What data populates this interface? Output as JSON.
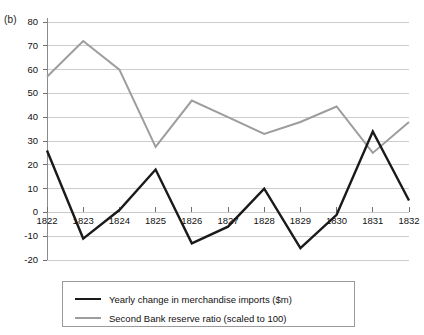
{
  "figure": {
    "panel_label": "(b)",
    "background_color": "#ffffff"
  },
  "chart_data": {
    "type": "line",
    "title": "",
    "subtitle": "",
    "xlabel": "",
    "ylabel": "",
    "categories": [
      "1822",
      "1823",
      "1824",
      "1825",
      "1826",
      "1827",
      "1828",
      "1829",
      "1830",
      "1831",
      "1832"
    ],
    "x_tick_labels": [
      "1822",
      "1823",
      "1824",
      "1825",
      "1826",
      "1827",
      "1828",
      "1829",
      "1830",
      "1831",
      "1832"
    ],
    "y_tick_labels": [
      "80",
      "70",
      "60",
      "50",
      "40",
      "30",
      "20",
      "10",
      "0",
      "-10",
      "-20"
    ],
    "y_ticks": [
      80,
      70,
      60,
      50,
      40,
      30,
      20,
      10,
      0,
      -10,
      -20
    ],
    "ylim": [
      -20,
      80
    ],
    "grid": true,
    "grid_color": "#c8c8c8",
    "zero_line": 0,
    "legend_position": "bottom",
    "series": [
      {
        "name": "Yearly change in merchandise imports ($m)",
        "color": "#1a1a1a",
        "width": 2.4,
        "values": [
          26,
          -11,
          1,
          18,
          -13,
          -6,
          10,
          -15,
          -1,
          34,
          5
        ]
      },
      {
        "name": "Second Bank reserve ratio (scaled to 100)",
        "color": "#9d9d9d",
        "width": 2.0,
        "values": [
          57,
          72,
          60,
          27.5,
          47,
          40,
          33,
          38,
          44.5,
          25,
          38
        ]
      }
    ]
  },
  "legend": {
    "entries": [
      {
        "label": "Yearly change in merchandise imports ($m)",
        "color": "#1a1a1a",
        "width": 2.6
      },
      {
        "label": "Second Bank reserve ratio (scaled to 100)",
        "color": "#9d9d9d",
        "width": 2.2
      }
    ]
  }
}
